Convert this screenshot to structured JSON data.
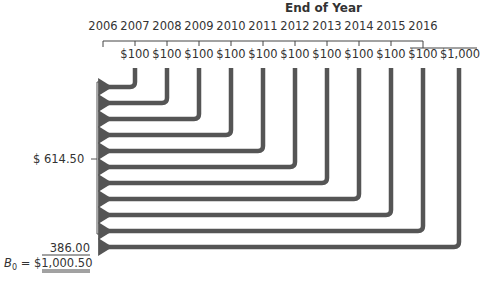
{
  "header": {
    "title": "End of Year"
  },
  "timeline": {
    "years": [
      "2006",
      "2007",
      "2008",
      "2009",
      "2010",
      "2011",
      "2012",
      "2013",
      "2014",
      "2015",
      "2016"
    ],
    "cash_flows": [
      "$100",
      "$100",
      "$100",
      "$100",
      "$100",
      "$100",
      "$100",
      "$100",
      "$100",
      "$100",
      "$1,000"
    ]
  },
  "valuation": {
    "coupon_pv_label": "$  614.50",
    "principal_pv_label": "386.00",
    "bond_value_prefix": "B",
    "bond_value_subscript": "0",
    "bond_value_equals": " = ",
    "bond_value": "$1,000.50"
  },
  "colors": {
    "arrow": "#555555",
    "line": "#444444"
  }
}
